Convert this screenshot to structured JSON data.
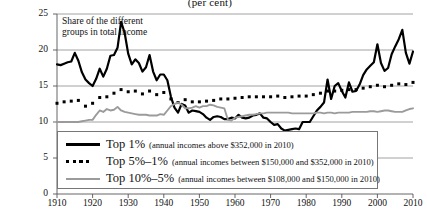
{
  "chart_data": {
    "type": "line",
    "title": "(per cent)",
    "annotation": "Share of the different groups in total income",
    "xlabel": "",
    "ylabel": "",
    "xlim": [
      1910,
      2010
    ],
    "ylim": [
      0,
      25
    ],
    "xticks": [
      1910,
      1920,
      1930,
      1940,
      1950,
      1960,
      1970,
      1980,
      1990,
      2000,
      2010
    ],
    "yticks": [
      0,
      5,
      10,
      15,
      20,
      25
    ],
    "grid": "horizontal",
    "legend_position": "bottom-left",
    "series": [
      {
        "name": "Top 1%",
        "note": "(annual incomes above $352,000 in 2010)",
        "style": "solid",
        "color": "#000000",
        "x": [
          1910,
          1911,
          1912,
          1913,
          1914,
          1915,
          1916,
          1917,
          1918,
          1919,
          1920,
          1921,
          1922,
          1923,
          1924,
          1925,
          1926,
          1927,
          1928,
          1929,
          1930,
          1931,
          1932,
          1933,
          1934,
          1935,
          1936,
          1937,
          1938,
          1939,
          1940,
          1941,
          1942,
          1943,
          1944,
          1945,
          1946,
          1947,
          1948,
          1949,
          1950,
          1951,
          1952,
          1953,
          1954,
          1955,
          1956,
          1957,
          1958,
          1959,
          1960,
          1961,
          1962,
          1963,
          1964,
          1965,
          1966,
          1967,
          1968,
          1969,
          1970,
          1971,
          1972,
          1973,
          1974,
          1975,
          1976,
          1977,
          1978,
          1979,
          1980,
          1981,
          1982,
          1983,
          1984,
          1985,
          1986,
          1987,
          1988,
          1989,
          1990,
          1991,
          1992,
          1993,
          1994,
          1995,
          1996,
          1997,
          1998,
          1999,
          2000,
          2001,
          2002,
          2003,
          2004,
          2005,
          2006,
          2007,
          2008,
          2009,
          2010
        ],
        "values": [
          18.0,
          17.9,
          18.1,
          18.3,
          18.4,
          19.6,
          18.5,
          16.9,
          15.9,
          15.4,
          15.0,
          16.0,
          17.4,
          16.3,
          17.4,
          19.2,
          19.3,
          20.3,
          23.9,
          22.4,
          19.5,
          18.0,
          18.7,
          18.2,
          17.0,
          17.6,
          19.3,
          17.0,
          15.8,
          16.6,
          16.6,
          15.8,
          13.5,
          12.0,
          11.3,
          12.5,
          12.3,
          11.3,
          11.6,
          11.5,
          11.4,
          11.1,
          10.6,
          10.3,
          10.7,
          10.8,
          10.7,
          10.4,
          10.4,
          10.6,
          10.5,
          11.0,
          10.6,
          10.5,
          10.6,
          10.9,
          11.0,
          11.2,
          10.6,
          10.5,
          10.0,
          9.6,
          9.7,
          9.1,
          8.8,
          8.9,
          9.0,
          9.1,
          9.0,
          10.0,
          10.0,
          10.0,
          10.8,
          11.6,
          12.1,
          12.7,
          15.9,
          13.2,
          15.0,
          15.4,
          14.3,
          13.4,
          15.5,
          14.2,
          14.3,
          15.2,
          16.5,
          17.3,
          17.8,
          18.3,
          20.8,
          18.2,
          17.1,
          17.5,
          19.4,
          20.5,
          21.5,
          22.8,
          19.6,
          18.1,
          19.8
        ]
      },
      {
        "name": "Top 5%–1%",
        "note": "(annual incomes between $150,000 and $352,000 in 2010)",
        "style": "dotted",
        "color": "#000000",
        "x": [
          1910,
          1911,
          1912,
          1913,
          1914,
          1915,
          1916,
          1917,
          1918,
          1919,
          1920,
          1921,
          1922,
          1923,
          1924,
          1925,
          1926,
          1927,
          1928,
          1929,
          1930,
          1931,
          1932,
          1933,
          1934,
          1935,
          1936,
          1937,
          1938,
          1939,
          1940,
          1941,
          1942,
          1943,
          1944,
          1945,
          1946,
          1947,
          1948,
          1949,
          1950,
          1951,
          1952,
          1953,
          1954,
          1955,
          1956,
          1957,
          1958,
          1959,
          1960,
          1961,
          1962,
          1963,
          1964,
          1965,
          1966,
          1967,
          1968,
          1969,
          1970,
          1971,
          1972,
          1973,
          1974,
          1975,
          1976,
          1977,
          1978,
          1979,
          1980,
          1981,
          1982,
          1983,
          1984,
          1985,
          1986,
          1987,
          1988,
          1989,
          1990,
          1991,
          1992,
          1993,
          1994,
          1995,
          1996,
          1997,
          1998,
          1999,
          2000,
          2001,
          2002,
          2003,
          2004,
          2005,
          2006,
          2007,
          2008,
          2009,
          2010
        ],
        "values": [
          12.6,
          12.7,
          12.8,
          13.0,
          12.9,
          13.4,
          13.0,
          12.4,
          12.2,
          12.3,
          12.6,
          13.0,
          13.4,
          13.1,
          13.5,
          13.9,
          14.0,
          14.2,
          14.5,
          14.4,
          14.2,
          14.1,
          14.3,
          14.0,
          13.9,
          14.0,
          14.3,
          14.0,
          13.8,
          14.0,
          14.1,
          14.0,
          13.2,
          12.9,
          12.7,
          13.2,
          13.1,
          12.9,
          12.8,
          12.9,
          12.8,
          12.9,
          12.9,
          12.9,
          13.0,
          13.1,
          13.2,
          13.2,
          13.2,
          13.3,
          13.3,
          13.4,
          13.4,
          13.4,
          13.5,
          13.5,
          13.5,
          13.6,
          13.5,
          13.6,
          13.5,
          13.5,
          13.6,
          13.5,
          13.4,
          13.4,
          13.5,
          13.5,
          13.6,
          13.6,
          13.6,
          13.7,
          13.8,
          13.9,
          14.0,
          14.1,
          14.3,
          14.2,
          14.3,
          14.4,
          14.4,
          14.3,
          14.5,
          14.4,
          14.5,
          14.6,
          14.7,
          14.8,
          14.9,
          15.0,
          15.1,
          15.0,
          14.9,
          15.0,
          15.1,
          15.2,
          15.3,
          15.3,
          15.2,
          15.2,
          15.5
        ]
      },
      {
        "name": "Top 10%–5%",
        "note": "(annual incomes between $108,000 and $150,000 in 2010)",
        "style": "solid",
        "color": "#9b9b9b",
        "x": [
          1910,
          1911,
          1912,
          1913,
          1914,
          1915,
          1916,
          1917,
          1918,
          1919,
          1920,
          1921,
          1922,
          1923,
          1924,
          1925,
          1926,
          1927,
          1928,
          1929,
          1930,
          1931,
          1932,
          1933,
          1934,
          1935,
          1936,
          1937,
          1938,
          1939,
          1940,
          1941,
          1942,
          1943,
          1944,
          1945,
          1946,
          1947,
          1948,
          1949,
          1950,
          1951,
          1952,
          1953,
          1954,
          1955,
          1956,
          1957,
          1958,
          1959,
          1960,
          1961,
          1962,
          1963,
          1964,
          1965,
          1966,
          1967,
          1968,
          1969,
          1970,
          1971,
          1972,
          1973,
          1974,
          1975,
          1976,
          1977,
          1978,
          1979,
          1980,
          1981,
          1982,
          1983,
          1984,
          1985,
          1986,
          1987,
          1988,
          1989,
          1990,
          1991,
          1992,
          1993,
          1994,
          1995,
          1996,
          1997,
          1998,
          1999,
          2000,
          2001,
          2002,
          2003,
          2004,
          2005,
          2006,
          2007,
          2008,
          2009,
          2010
        ],
        "values": [
          10.0,
          10.0,
          10.0,
          10.0,
          10.0,
          10.0,
          10.0,
          10.1,
          10.2,
          10.3,
          10.3,
          11.0,
          11.6,
          11.4,
          11.8,
          11.6,
          11.7,
          12.1,
          11.6,
          11.4,
          11.3,
          11.2,
          11.1,
          11.0,
          11.0,
          11.0,
          10.9,
          10.9,
          10.9,
          11.1,
          11.0,
          11.6,
          12.2,
          12.5,
          12.7,
          12.4,
          11.9,
          11.9,
          12.0,
          12.2,
          12.0,
          12.2,
          12.2,
          12.4,
          12.3,
          12.1,
          12.0,
          11.9,
          10.3,
          10.2,
          10.6,
          10.7,
          10.8,
          10.9,
          11.0,
          11.0,
          11.1,
          11.2,
          11.2,
          11.3,
          11.3,
          11.3,
          11.3,
          11.3,
          11.3,
          11.3,
          11.2,
          11.2,
          11.2,
          11.2,
          11.2,
          11.2,
          11.2,
          11.3,
          11.3,
          11.2,
          11.3,
          11.3,
          11.2,
          11.3,
          11.3,
          11.3,
          11.3,
          11.4,
          11.4,
          11.4,
          11.4,
          11.4,
          11.5,
          11.5,
          11.4,
          11.5,
          11.6,
          11.6,
          11.5,
          11.4,
          11.4,
          11.4,
          11.6,
          11.8,
          11.9
        ]
      }
    ]
  },
  "axis": {
    "yticks": [
      "0",
      "5",
      "10",
      "15",
      "20",
      "25"
    ],
    "xticks": [
      "1910",
      "1920",
      "1930",
      "1940",
      "1950",
      "1960",
      "1970",
      "1980",
      "1990",
      "2000",
      "2010"
    ]
  },
  "legend": {
    "items": [
      {
        "label": "Top 1%",
        "note": "(annual incomes above $352,000 in 2010)",
        "swatch": "solid-black-line-icon"
      },
      {
        "label": "Top 5%–1%",
        "note": "(annual incomes between $150,000 and $352,000 in 2010)",
        "swatch": "dotted-black-line-icon"
      },
      {
        "label": "Top 10%–5%",
        "note": "(annual incomes between $108,000 and $150,000 in 2010)",
        "swatch": "solid-gray-line-icon"
      }
    ]
  }
}
